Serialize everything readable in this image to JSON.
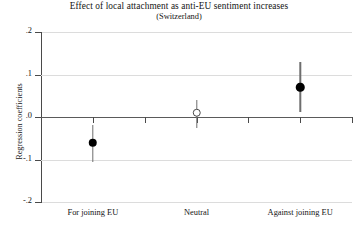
{
  "chart_data": {
    "type": "scatter",
    "title": "Effect of local attachment as anti-EU sentiment increases",
    "subtitle": "(Switzerland)",
    "xlabel": "",
    "ylabel": "Regression coefficients",
    "categories": [
      "For joining EU",
      "Neutral",
      "Against joining EU"
    ],
    "values": [
      -0.06,
      0.01,
      0.07
    ],
    "ci_low": [
      -0.105,
      -0.025,
      0.012
    ],
    "ci_high": [
      -0.018,
      0.04,
      0.13
    ],
    "marker_styles": [
      "filled",
      "hollow",
      "filled"
    ],
    "ylim": [
      -0.2,
      0.2
    ],
    "ytick_values": [
      0.2,
      0.1,
      0.0,
      -0.1,
      -0.2
    ],
    "ytick_labels": [
      ".2",
      ".1",
      ".0",
      "-.1",
      "-.2"
    ],
    "grid": true,
    "zero_line": true,
    "legend": null,
    "series": [
      {
        "name": "Regression coefficient",
        "points": [
          {
            "category": "For joining EU",
            "value": -0.06,
            "ci_low": -0.105,
            "ci_high": -0.018,
            "marker": "filled"
          },
          {
            "category": "Neutral",
            "value": 0.01,
            "ci_low": -0.025,
            "ci_high": 0.04,
            "marker": "hollow"
          },
          {
            "category": "Against joining EU",
            "value": 0.07,
            "ci_low": 0.012,
            "ci_high": 0.13,
            "marker": "filled"
          }
        ]
      }
    ],
    "colors": {
      "marker_filled": "#000000",
      "marker_hollow_edge": "#4a4a4a",
      "errorbar": "#6e6e6e",
      "gridline": "#dcdcdc",
      "zero_line": "#5a5a5a",
      "axis": "#4a4a4a",
      "background": "#ffffff",
      "text": "#141414"
    }
  }
}
